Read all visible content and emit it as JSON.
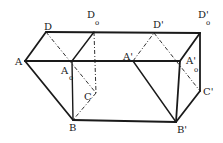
{
  "diagram": {
    "type": "geometric prism cross-section figure",
    "points": {
      "A": {
        "label": "A",
        "sub": "",
        "x": 25,
        "y": 61
      },
      "D": {
        "label": "D",
        "sub": "",
        "x": 46,
        "y": 32
      },
      "D0": {
        "label": "D",
        "sub": "o",
        "x": 94,
        "y": 32
      },
      "A0": {
        "label": "A",
        "sub": "o",
        "x": 72,
        "y": 61
      },
      "C": {
        "label": "C",
        "sub": "",
        "x": 96,
        "y": 93
      },
      "B": {
        "label": "B",
        "sub": "",
        "x": 73,
        "y": 120
      },
      "Ap": {
        "label": "A'",
        "sub": "",
        "x": 133,
        "y": 61
      },
      "Dp": {
        "label": "D'",
        "sub": "",
        "x": 154,
        "y": 33
      },
      "D0p": {
        "label": "D'",
        "sub": "o",
        "x": 200,
        "y": 33
      },
      "A0p": {
        "label": "A'",
        "sub": "o",
        "x": 180,
        "y": 61
      },
      "Cp": {
        "label": "C'",
        "sub": "",
        "x": 200,
        "y": 91
      },
      "Bp": {
        "label": "B'",
        "sub": "",
        "x": 176,
        "y": 122
      }
    },
    "labels": [
      {
        "id": "A",
        "text": "A",
        "sub": ""
      },
      {
        "id": "D",
        "text": "D",
        "sub": ""
      },
      {
        "id": "D0",
        "text": "D",
        "sub": "o"
      },
      {
        "id": "A0",
        "text": "A",
        "sub": "o"
      },
      {
        "id": "C",
        "text": "C",
        "sub": ""
      },
      {
        "id": "B",
        "text": "B",
        "sub": ""
      },
      {
        "id": "Ap",
        "text": "A'",
        "sub": ""
      },
      {
        "id": "Dp",
        "text": "D'",
        "sub": ""
      },
      {
        "id": "D0p",
        "text": "D'",
        "sub": "o"
      },
      {
        "id": "A0p",
        "text": "A'",
        "sub": "o"
      },
      {
        "id": "Cp",
        "text": "C'",
        "sub": ""
      },
      {
        "id": "Bp",
        "text": "B'",
        "sub": ""
      }
    ],
    "solid_edges": [
      [
        "A",
        "D"
      ],
      [
        "D",
        "D0p"
      ],
      [
        "A",
        "A0p"
      ],
      [
        "D0",
        "A0"
      ],
      [
        "A",
        "B"
      ],
      [
        "A0",
        "B"
      ],
      [
        "B",
        "Bp"
      ],
      [
        "Ap",
        "Bp"
      ],
      [
        "A0p",
        "Bp"
      ],
      [
        "A0p",
        "D0p"
      ],
      [
        "D0p",
        "Cp"
      ],
      [
        "Cp",
        "Bp"
      ]
    ],
    "dashed_edges": [
      [
        "D",
        "C"
      ],
      [
        "D0",
        "C"
      ],
      [
        "C",
        "B"
      ],
      [
        "Ap",
        "Dp"
      ],
      [
        "Dp",
        "Cp"
      ]
    ]
  }
}
